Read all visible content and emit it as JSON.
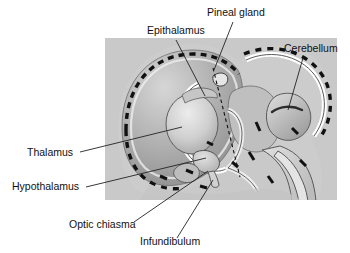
{
  "figure": {
    "kind": "anatomical-diagram",
    "background_color": "#ffffff",
    "panel_color": "#c9c9c9"
  },
  "colors": {
    "panel_gray": "#c9c9c9",
    "cortex_gray": "#b4b4b4",
    "hemisphere_gray": "#a8a8a8",
    "thalamus_light": "#d8d8d8",
    "ventricle_light": "#dedede",
    "outline": "#3a3a3a",
    "dash_black": "#111111",
    "leader_line": "#222222",
    "text": "#111111"
  },
  "labels": [
    {
      "id": "pineal-gland",
      "text": "Pineal gland",
      "x": 207,
      "y": 16,
      "anchor": "start",
      "leader": {
        "x1": 233,
        "y1": 22,
        "x2": 214,
        "y2": 70
      }
    },
    {
      "id": "epithalamus",
      "text": "Epithalamus",
      "x": 147,
      "y": 34,
      "anchor": "start",
      "leader": {
        "x1": 176,
        "y1": 40,
        "x2": 205,
        "y2": 96
      }
    },
    {
      "id": "cerebellum",
      "text": "Cerebellum",
      "x": 284,
      "y": 52,
      "anchor": "start",
      "leader": {
        "x1": 303,
        "y1": 58,
        "x2": 288,
        "y2": 110
      }
    },
    {
      "id": "thalamus",
      "text": "Thalamus",
      "x": 27,
      "y": 156,
      "anchor": "start",
      "leader": {
        "x1": 80,
        "y1": 152,
        "x2": 182,
        "y2": 127
      }
    },
    {
      "id": "hypothalamus",
      "text": "Hypothalamus",
      "x": 12,
      "y": 190,
      "anchor": "start",
      "leader": {
        "x1": 86,
        "y1": 187,
        "x2": 206,
        "y2": 158
      }
    },
    {
      "id": "optic-chiasma",
      "text": "Optic chiasma",
      "x": 69,
      "y": 228,
      "anchor": "start",
      "leader": {
        "x1": 134,
        "y1": 222,
        "x2": 208,
        "y2": 171
      }
    },
    {
      "id": "infundibulum",
      "text": "Infundibulum",
      "x": 140,
      "y": 245,
      "anchor": "start",
      "leader": {
        "x1": 177,
        "y1": 238,
        "x2": 213,
        "y2": 180
      }
    }
  ],
  "midline_marker": {
    "id": "midline-dashed-axis",
    "x1": 213,
    "y1": 68,
    "x2": 240,
    "y2": 177,
    "style": "dashed"
  }
}
